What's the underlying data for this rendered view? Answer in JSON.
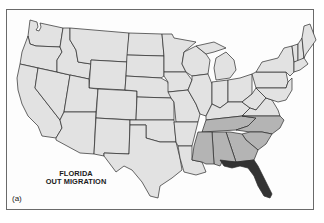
{
  "map": {
    "title_line1": "FLORIDA",
    "title_line2": "OUT MIGRATION",
    "panel_label": "(a)",
    "colors": {
      "background": "#fdfdfd",
      "other_states": "#e2e2e2",
      "destination_states": "#b4b4b4",
      "origin_state": "#333333",
      "border": "#2a2a2a"
    },
    "origin_state": "Florida",
    "destination_states": [
      "Tennessee",
      "North Carolina",
      "South Carolina",
      "Georgia",
      "Alabama",
      "Mississippi"
    ]
  }
}
